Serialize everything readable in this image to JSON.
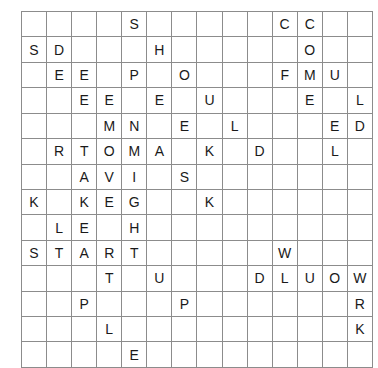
{
  "puzzle": {
    "type": "word-search-grid",
    "rows": 14,
    "columns": 14,
    "cell_width_px": 24,
    "cell_height_px": 24,
    "grid_border_color": "#8c8c8c",
    "letter_color": "#1a1a1a",
    "background_color": "#ffffff",
    "grid": [
      [
        "",
        "",
        "",
        "",
        "S",
        "",
        "",
        "",
        "",
        "",
        "C",
        "C",
        "",
        ""
      ],
      [
        "S",
        "D",
        "",
        "",
        "",
        "H",
        "",
        "",
        "",
        "",
        "",
        "O",
        "",
        ""
      ],
      [
        "",
        "E",
        "E",
        "",
        "P",
        "",
        "O",
        "",
        "",
        "",
        "F",
        "M",
        "U",
        ""
      ],
      [
        "",
        "",
        "E",
        "E",
        "",
        "E",
        "",
        "U",
        "",
        "",
        "",
        "E",
        "",
        "L"
      ],
      [
        "",
        "",
        "",
        "M",
        "N",
        "",
        "E",
        "",
        "L",
        "",
        "",
        "",
        "E",
        "D"
      ],
      [
        "",
        "R",
        "T",
        "O",
        "M",
        "A",
        "",
        "K",
        "",
        "D",
        "",
        "",
        "L",
        ""
      ],
      [
        "",
        "",
        "A",
        "V",
        "I",
        "",
        "S",
        "",
        "",
        "",
        "",
        "",
        "",
        ""
      ],
      [
        "K",
        "",
        "K",
        "E",
        "G",
        "",
        "",
        "K",
        "",
        "",
        "",
        "",
        "",
        ""
      ],
      [
        "",
        "L",
        "E",
        "",
        "H",
        "",
        "",
        "",
        "",
        "",
        "",
        "",
        "",
        ""
      ],
      [
        "S",
        "T",
        "A",
        "R",
        "T",
        "",
        "",
        "",
        "",
        "",
        "W",
        "",
        "",
        ""
      ],
      [
        "",
        "",
        "",
        "T",
        "",
        "U",
        "",
        "",
        "",
        "D",
        "L",
        "U",
        "O",
        "W"
      ],
      [
        "",
        "",
        "P",
        "",
        "",
        "",
        "P",
        "",
        "",
        "",
        "",
        "",
        "",
        "R"
      ],
      [
        "",
        "",
        "",
        "L",
        "",
        "",
        "",
        "",
        "",
        "",
        "",
        "",
        "",
        "K"
      ],
      [
        "",
        "",
        "",
        "",
        "E",
        "",
        "",
        "",
        "",
        "",
        "",
        "",
        "",
        ""
      ],
      [
        "",
        "",
        "K",
        "N",
        "I",
        "H",
        "T",
        "R",
        "Y",
        "",
        "",
        "",
        "",
        ""
      ]
    ]
  }
}
